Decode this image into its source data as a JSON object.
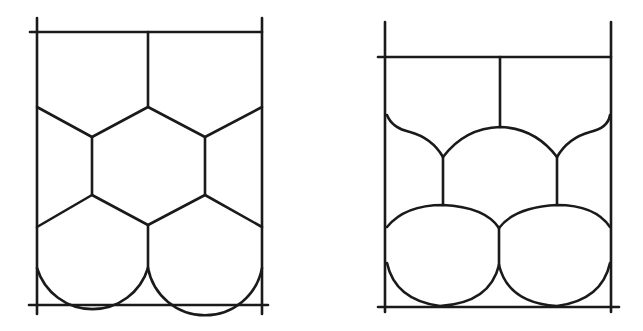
{
  "figure": {
    "stroke_color": "#1a1a1a",
    "background": "#ffffff",
    "panels": [
      {
        "name": "left-panel",
        "style": "dry foam with straight polygonal (hexagonal) cell walls"
      },
      {
        "name": "right-panel",
        "style": "wetter foam with curved cell walls and rounded bubbles"
      }
    ]
  }
}
